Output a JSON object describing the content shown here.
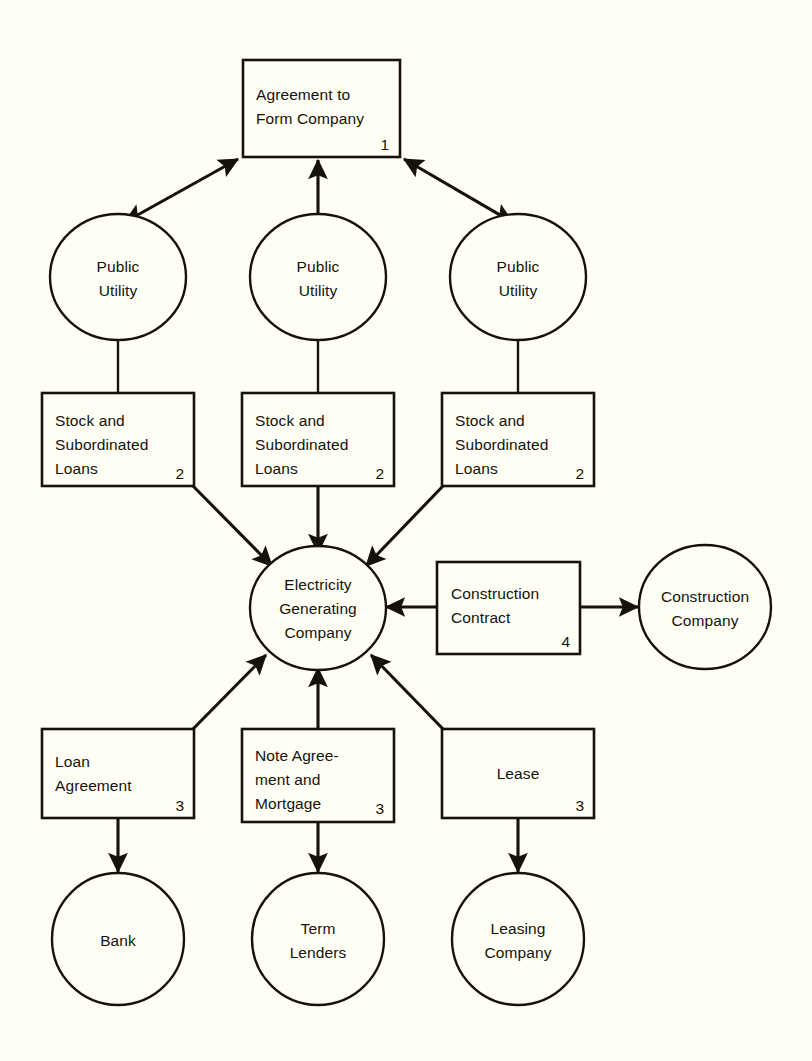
{
  "diagram": {
    "background_color": "#fffef5",
    "line_color": "#15120c",
    "text_color": "#15120c",
    "nodes": {
      "agreement_to_form_company": {
        "shape": "box",
        "ref": "1",
        "line1": "Agreement to",
        "line2": "Form Company",
        "align": "left"
      },
      "public_utility_left": {
        "shape": "ellipse",
        "line1": "Public",
        "line2": "Utility"
      },
      "public_utility_center": {
        "shape": "ellipse",
        "line1": "Public",
        "line2": "Utility"
      },
      "public_utility_right": {
        "shape": "ellipse",
        "line1": "Public",
        "line2": "Utility"
      },
      "stock_and_subordinated_loans_left": {
        "shape": "box",
        "ref": "2",
        "line1": "Stock and",
        "line2": "Subordinated",
        "line3": "Loans",
        "align": "left"
      },
      "stock_and_subordinated_loans_center": {
        "shape": "box",
        "ref": "2",
        "line1": "Stock and",
        "line2": "Subordinated",
        "line3": "Loans",
        "align": "left"
      },
      "stock_and_subordinated_loans_right": {
        "shape": "box",
        "ref": "2",
        "line1": "Stock and",
        "line2": "Subordinated",
        "line3": "Loans",
        "align": "left"
      },
      "electricity_generating_company": {
        "shape": "ellipse",
        "line1": "Electricity",
        "line2": "Generating",
        "line3": "Company"
      },
      "construction_contract": {
        "shape": "box",
        "ref": "4",
        "line1": "Construction",
        "line2": "Contract",
        "align": "left"
      },
      "construction_company": {
        "shape": "ellipse",
        "line1": "Construction",
        "line2": "Company"
      },
      "loan_agreement": {
        "shape": "box",
        "ref": "3",
        "line1": "Loan",
        "line2": "Agreement",
        "align": "left"
      },
      "note_agreement_and_mortgage": {
        "shape": "box",
        "ref": "3",
        "line1": "Note Agree-",
        "line2": "ment and",
        "line3": "Mortgage",
        "align": "left"
      },
      "lease": {
        "shape": "box",
        "ref": "3",
        "line1": "Lease",
        "align": "center"
      },
      "bank": {
        "shape": "ellipse",
        "line1": "Bank"
      },
      "term_lenders": {
        "shape": "ellipse",
        "line1": "Term",
        "line2": "Lenders"
      },
      "leasing_company": {
        "shape": "ellipse",
        "line1": "Leasing",
        "line2": "Company"
      }
    },
    "edges": [
      {
        "from": "public_utility_left",
        "to": "agreement_to_form_company",
        "arrow": "both"
      },
      {
        "from": "public_utility_center",
        "to": "agreement_to_form_company",
        "arrow": "to"
      },
      {
        "from": "public_utility_right",
        "to": "agreement_to_form_company",
        "arrow": "both"
      },
      {
        "from": "public_utility_left",
        "to": "stock_and_subordinated_loans_left",
        "arrow": "none"
      },
      {
        "from": "public_utility_center",
        "to": "stock_and_subordinated_loans_center",
        "arrow": "none"
      },
      {
        "from": "public_utility_right",
        "to": "stock_and_subordinated_loans_right",
        "arrow": "none"
      },
      {
        "from": "stock_and_subordinated_loans_left",
        "to": "electricity_generating_company",
        "arrow": "to"
      },
      {
        "from": "stock_and_subordinated_loans_center",
        "to": "electricity_generating_company",
        "arrow": "to"
      },
      {
        "from": "stock_and_subordinated_loans_right",
        "to": "electricity_generating_company",
        "arrow": "to"
      },
      {
        "from": "construction_contract",
        "to": "electricity_generating_company",
        "arrow": "to"
      },
      {
        "from": "construction_contract",
        "to": "construction_company",
        "arrow": "to"
      },
      {
        "from": "loan_agreement",
        "to": "electricity_generating_company",
        "arrow": "to"
      },
      {
        "from": "note_agreement_and_mortgage",
        "to": "electricity_generating_company",
        "arrow": "to"
      },
      {
        "from": "lease",
        "to": "electricity_generating_company",
        "arrow": "to"
      },
      {
        "from": "loan_agreement",
        "to": "bank",
        "arrow": "to"
      },
      {
        "from": "note_agreement_and_mortgage",
        "to": "term_lenders",
        "arrow": "to"
      },
      {
        "from": "lease",
        "to": "leasing_company",
        "arrow": "to"
      }
    ]
  }
}
